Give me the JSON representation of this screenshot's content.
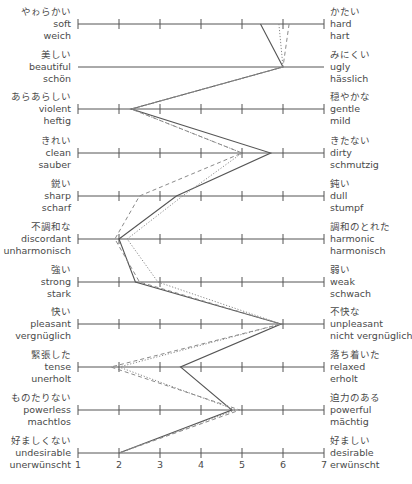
{
  "chart_data": {
    "type": "line",
    "title": "",
    "subtitle": "Semantic differential profile (Japanese / English / German adjective pairs)",
    "xlabel": "",
    "ylabel": "",
    "xlim": [
      1,
      7
    ],
    "x_ticks": [
      "1",
      "2",
      "3",
      "4",
      "5",
      "6",
      "7"
    ],
    "grid": false,
    "legend": null,
    "scales": [
      {
        "left": {
          "ja": "やゎらかい",
          "en": "soft",
          "de": "weich"
        },
        "right": {
          "ja": "かたい",
          "en": "hard",
          "de": "hart"
        },
        "ticks": true
      },
      {
        "left": {
          "ja": "美しい",
          "en": "beautiful",
          "de": "schön"
        },
        "right": {
          "ja": "みにくい",
          "en": "ugly",
          "de": "hässlich"
        },
        "ticks": false
      },
      {
        "left": {
          "ja": "あらあらしい",
          "en": "violent",
          "de": "heftig"
        },
        "right": {
          "ja": "穏やかな",
          "en": "gentle",
          "de": "mild"
        },
        "ticks": true
      },
      {
        "left": {
          "ja": "きれい",
          "en": "clean",
          "de": "sauber"
        },
        "right": {
          "ja": "きたない",
          "en": "dirty",
          "de": "schmutzig"
        },
        "ticks": true
      },
      {
        "left": {
          "ja": "鋭い",
          "en": "sharp",
          "de": "scharf"
        },
        "right": {
          "ja": "鈍い",
          "en": "dull",
          "de": "stumpf"
        },
        "ticks": true
      },
      {
        "left": {
          "ja": "不調和な",
          "en": "discordant",
          "de": "unharmonisch"
        },
        "right": {
          "ja": "調和のとれた",
          "en": "harmonic",
          "de": "harmonisch"
        },
        "ticks": true
      },
      {
        "left": {
          "ja": "強い",
          "en": "strong",
          "de": "stark"
        },
        "right": {
          "ja": "弱い",
          "en": "weak",
          "de": "schwach"
        },
        "ticks": true
      },
      {
        "left": {
          "ja": "快い",
          "en": "pleasant",
          "de": "vergnüglich"
        },
        "right": {
          "ja": "不快な",
          "en": "unpleasant",
          "de": "nicht vergnüglich"
        },
        "ticks": true
      },
      {
        "left": {
          "ja": "緊張した",
          "en": "tense",
          "de": "unerholt"
        },
        "right": {
          "ja": "落ち着いた",
          "en": "relaxed",
          "de": "erholt"
        },
        "ticks": true
      },
      {
        "left": {
          "ja": "ものたりない",
          "en": "powerless",
          "de": "machtlos"
        },
        "right": {
          "ja": "迫力のある",
          "en": "powerful",
          "de": "mächtig"
        },
        "ticks": true
      },
      {
        "left": {
          "ja": "好ましくない",
          "en": "undesirable",
          "de": "unerwünscht"
        },
        "right": {
          "ja": "好ましい",
          "en": "desirable",
          "de": "erwünscht"
        },
        "ticks": true
      }
    ],
    "series": [
      {
        "name": "solid",
        "style": "solid",
        "color": "#555555",
        "values": [
          5.45,
          6.0,
          2.3,
          5.7,
          3.4,
          2.0,
          2.4,
          5.95,
          3.5,
          4.75,
          2.0
        ]
      },
      {
        "name": "dotted",
        "style": "dotted",
        "color": "#8a8a8a",
        "values": [
          5.9,
          6.0,
          2.3,
          5.0,
          3.55,
          2.2,
          2.95,
          5.95,
          2.0,
          4.85,
          2.0
        ]
      },
      {
        "name": "dashed",
        "style": "dashed",
        "color": "#8a8a8a",
        "values": [
          6.15,
          6.0,
          2.3,
          5.0,
          2.5,
          1.9,
          2.5,
          5.95,
          1.8,
          4.95,
          2.0
        ]
      }
    ]
  },
  "layout": {
    "x_px_at_1": 78,
    "x_px_step": 41,
    "row_y_px": [
      24,
      67,
      109,
      153,
      196,
      239,
      282,
      324,
      367,
      410,
      453
    ],
    "axis_color": "#555555"
  }
}
